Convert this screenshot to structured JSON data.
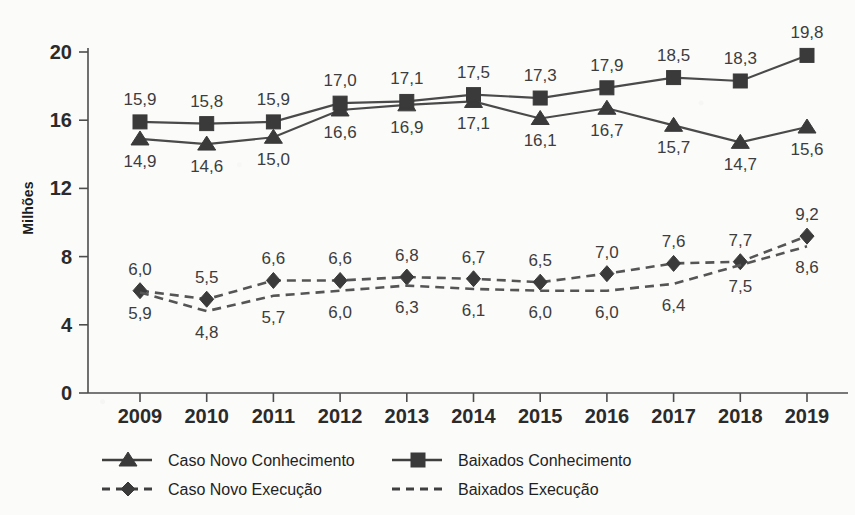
{
  "chart_data": {
    "type": "line",
    "title": "",
    "xlabel": "",
    "ylabel": "Milhões",
    "x": [
      "2009",
      "2010",
      "2011",
      "2012",
      "2013",
      "2014",
      "2015",
      "2016",
      "2017",
      "2018",
      "2019"
    ],
    "ylim": [
      0,
      20
    ],
    "yticks": [
      "0",
      "4",
      "8",
      "12",
      "16",
      "20"
    ],
    "grid": false,
    "legend_position": "bottom",
    "decimal_separator": ",",
    "series": [
      {
        "name": "Caso Novo Conhecimento",
        "marker": "triangle",
        "line_style": "solid",
        "color": "#3a3a3a",
        "values": [
          14.9,
          14.6,
          15.0,
          16.6,
          16.9,
          17.1,
          16.1,
          16.7,
          15.7,
          14.7,
          15.6
        ],
        "labels": [
          "14,9",
          "14,6",
          "15,0",
          "16,6",
          "16,9",
          "17,1",
          "16,1",
          "16,7",
          "15,7",
          "14,7",
          "15,6"
        ],
        "label_positions": [
          "below",
          "below",
          "below",
          "below",
          "below",
          "below",
          "below",
          "below",
          "below",
          "below",
          "below"
        ]
      },
      {
        "name": "Baixados Conhecimento",
        "marker": "square",
        "line_style": "solid",
        "color": "#3a3a3a",
        "values": [
          15.9,
          15.8,
          15.9,
          17.0,
          17.1,
          17.5,
          17.3,
          17.9,
          18.5,
          18.3,
          19.8
        ],
        "labels": [
          "15,9",
          "15,8",
          "15,9",
          "17,0",
          "17,1",
          "17,5",
          "17,3",
          "17,9",
          "18,5",
          "18,3",
          "19,8"
        ],
        "label_positions": [
          "above",
          "above",
          "above",
          "above",
          "above",
          "above",
          "above",
          "above",
          "above",
          "above",
          "above"
        ]
      },
      {
        "name": "Caso Novo Execução",
        "marker": "diamond",
        "line_style": "dashed",
        "color": "#3a3a3a",
        "values": [
          6.0,
          5.5,
          6.6,
          6.6,
          6.8,
          6.7,
          6.5,
          7.0,
          7.6,
          7.7,
          9.2
        ],
        "labels": [
          "6,0",
          "5,5",
          "6,6",
          "6,6",
          "6,8",
          "6,7",
          "6,5",
          "7,0",
          "7,6",
          "7,7",
          "9,2"
        ],
        "label_positions": [
          "above",
          "above",
          "above",
          "above",
          "above",
          "above",
          "above",
          "above",
          "above",
          "above",
          "above"
        ]
      },
      {
        "name": "Baixados Execução",
        "marker": "none",
        "line_style": "dashed",
        "color": "#3a3a3a",
        "values": [
          5.9,
          4.8,
          5.7,
          6.0,
          6.3,
          6.1,
          6.0,
          6.0,
          6.4,
          7.5,
          8.6
        ],
        "labels": [
          "5,9",
          "4,8",
          "5,7",
          "6,0",
          "6,3",
          "6,1",
          "6,0",
          "6,0",
          "6,4",
          "7,5",
          "8,6"
        ],
        "label_positions": [
          "below",
          "below",
          "below",
          "below",
          "below",
          "below",
          "below",
          "below",
          "below",
          "below",
          "below"
        ]
      }
    ]
  },
  "legend": {
    "entries": [
      {
        "label": "Caso Novo Conhecimento",
        "marker": "triangle",
        "line_style": "solid"
      },
      {
        "label": "Baixados Conhecimento",
        "marker": "square",
        "line_style": "solid"
      },
      {
        "label": "Caso Novo Execução",
        "marker": "diamond",
        "line_style": "dashed"
      },
      {
        "label": "Baixados Execução",
        "marker": "none",
        "line_style": "dashed"
      }
    ]
  }
}
